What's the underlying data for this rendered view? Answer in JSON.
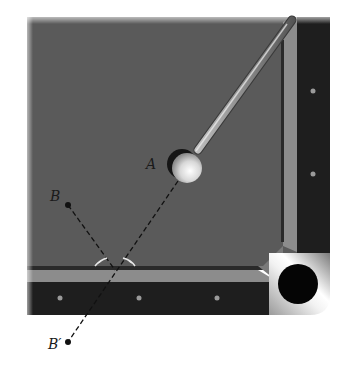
{
  "figure": {
    "labels": {
      "ball_a": "A",
      "point_b": "B",
      "point_b_prime": "B′"
    }
  },
  "colors": {
    "background": "#ffffff",
    "felt": "#5a5a5a",
    "cushion_light": "#8c8c8c",
    "cushion_dark": "#2a2a2a",
    "rail": "#1e1e1e",
    "rail_dot": "#9a9a9a",
    "pocket": "#050505",
    "angle_marks": "#e8e8e8",
    "dashed_line": "#111111"
  },
  "elements": {
    "cue_ball": "A",
    "object_point": "B",
    "mirror_image_point": "B′",
    "angle_arcs": 2,
    "rail_diamonds_bottom": 3,
    "rail_diamonds_right": 2
  }
}
